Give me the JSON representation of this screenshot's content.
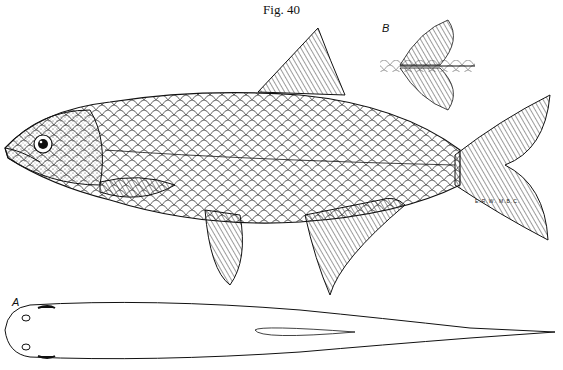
{
  "figure": {
    "title": "Fig. 40",
    "labels": {
      "dorsal_view": "A",
      "caudal_detail": "B"
    },
    "artist_initials": "E.R.W.   M.B.C."
  },
  "colors": {
    "ink": "#111111",
    "background": "#ffffff"
  }
}
